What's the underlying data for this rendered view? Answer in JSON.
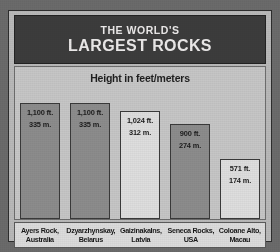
{
  "header": {
    "line1": "THE WORLD'S",
    "line2": "LARGEST ROCKS"
  },
  "subtitle": "Height in feet/meters",
  "colors": {
    "page_background": "#6b6b6b",
    "title_band": "#3c3c3c",
    "title_text": "#eceaea",
    "panel_background": "#c6c6c6",
    "bar_dark": "#8c8c8c",
    "bar_light": "#dedede",
    "bar_border": "#3a3a3a",
    "label_strip": "#dcdcdc",
    "text": "#1c1c1c"
  },
  "chart_data": {
    "type": "bar",
    "title": "THE WORLD'S LARGEST ROCKS",
    "subtitle": "Height in feet/meters",
    "xlabel": "",
    "ylabel": "Height in feet/meters",
    "ylim": [
      0,
      1100
    ],
    "grid": false,
    "legend": null,
    "categories": [
      "Ayers Rock, Australia",
      "Dzyarzhynskay, Belarus",
      "Gaizinakalns, Latvia",
      "Seneca Rocks, USA",
      "Coloane Alto, Macau"
    ],
    "values": [
      1100,
      1100,
      1024,
      900,
      571
    ],
    "units": "feet",
    "bars": [
      {
        "name": "Ayers Rock",
        "country": "Australia",
        "label_line1": "Ayers Rock,",
        "label_line2": "Australia",
        "feet": 1100,
        "meters": 335,
        "value_feet_text": "1,100 ft.",
        "value_meters_text": "335 m.",
        "fill": "dark"
      },
      {
        "name": "Dzyarzhynskay",
        "country": "Belarus",
        "label_line1": "Dzyarzhynskay,",
        "label_line2": "Belarus",
        "feet": 1100,
        "meters": 335,
        "value_feet_text": "1,100 ft.",
        "value_meters_text": "335 m.",
        "fill": "dark"
      },
      {
        "name": "Gaizinakalns",
        "country": "Latvia",
        "label_line1": "Gaizinakalns,",
        "label_line2": "Latvia",
        "feet": 1024,
        "meters": 312,
        "value_feet_text": "1,024 ft.",
        "value_meters_text": "312 m.",
        "fill": "light"
      },
      {
        "name": "Seneca Rocks",
        "country": "USA",
        "label_line1": "Seneca Rocks,",
        "label_line2": "USA",
        "feet": 900,
        "meters": 274,
        "value_feet_text": "900 ft.",
        "value_meters_text": "274 m.",
        "fill": "dark"
      },
      {
        "name": "Coloane Alto",
        "country": "Macau",
        "label_line1": "Coloane Alto,",
        "label_line2": "Macau",
        "feet": 571,
        "meters": 174,
        "value_feet_text": "571 ft.",
        "value_meters_text": "174 m.",
        "fill": "light"
      }
    ]
  }
}
